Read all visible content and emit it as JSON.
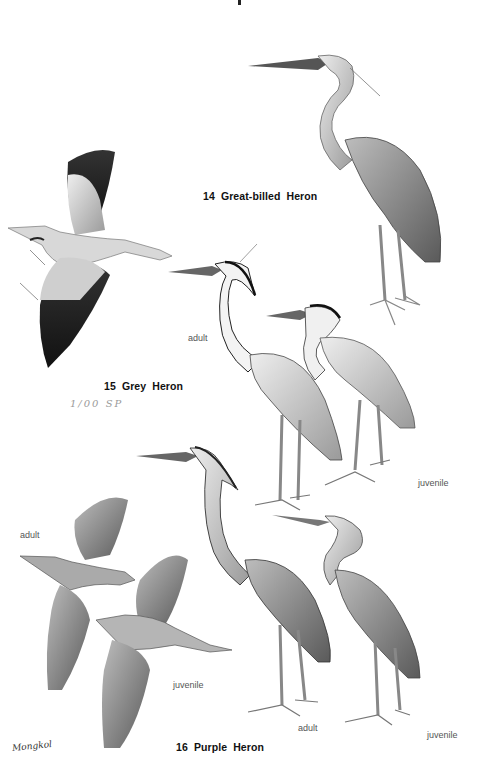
{
  "plate": {
    "background": "#ffffff",
    "species": [
      {
        "number": "14",
        "name": "Great-billed Heron",
        "figures": []
      },
      {
        "number": "15",
        "name": "Grey Heron",
        "figures": [
          "adult",
          "juvenile"
        ],
        "handwritten_note": "1/00 SP"
      },
      {
        "number": "16",
        "name": "Purple Heron",
        "figures": [
          "adult",
          "juvenile",
          "adult",
          "juvenile"
        ]
      }
    ],
    "labels": {
      "grey_adult": "adult",
      "grey_juvenile": "juvenile",
      "purple_flight_adult": "adult",
      "purple_flight_juvenile": "juvenile",
      "purple_standing_adult": "adult",
      "purple_standing_juvenile": "juvenile"
    },
    "artist_signature": "Mongkol"
  }
}
